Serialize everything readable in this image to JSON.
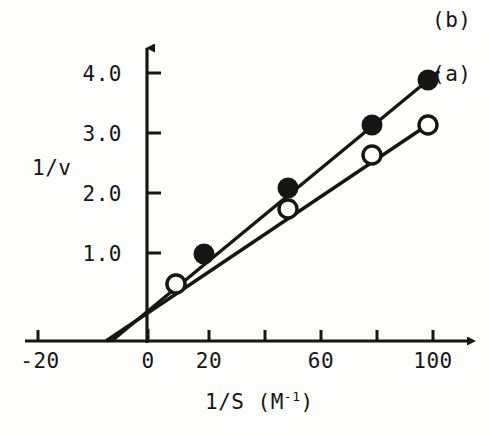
{
  "figure": {
    "background_color": "#fdfdfb",
    "ink_color": "#161616"
  },
  "chart_data": {
    "type": "line",
    "title": "",
    "subtitle": "",
    "xlabel": "1/S (M-1)",
    "xlabel_base": "1/S  (M",
    "xlabel_exponent": "-1",
    "xlabel_close": ")",
    "ylabel": "1/v",
    "xlim": [
      -28,
      112
    ],
    "ylim": [
      0,
      4.75
    ],
    "grid": false,
    "legend_position": "right-of-line-ends",
    "x_ticks": [
      -20,
      0,
      20,
      40,
      60,
      80,
      100
    ],
    "x_tick_labels": [
      "-20",
      "0",
      "20",
      "",
      "60",
      "",
      "100"
    ],
    "y_ticks": [
      1.0,
      2.0,
      3.0,
      4.0
    ],
    "y_tick_labels": [
      "1.0",
      "2.0",
      "3.0",
      "4.0"
    ],
    "x_intercept": -15,
    "y_intercept": 0.6,
    "series": [
      {
        "name": "(a)",
        "label": "(a)",
        "marker": "open-circle",
        "marker_fill": "#ffffff",
        "marker_stroke": "#161616",
        "line_color": "#161616",
        "x": [
          10,
          20,
          50,
          80,
          100
        ],
        "y": [
          0.95,
          1.45,
          2.2,
          3.1,
          3.6
        ],
        "line_from": [
          -15,
          0
        ],
        "line_to": [
          103,
          3.7
        ]
      },
      {
        "name": "(b)",
        "label": "(b)",
        "marker": "filled-circle",
        "marker_fill": "#161616",
        "marker_stroke": "#161616",
        "line_color": "#161616",
        "x": [
          10,
          20,
          50,
          80,
          100
        ],
        "y": [
          0.95,
          1.45,
          2.55,
          3.6,
          4.35
        ],
        "line_from": [
          -13,
          0
        ],
        "line_to": [
          104,
          4.5
        ]
      }
    ]
  },
  "labels": {
    "series_a": "(a)",
    "series_b": "(b)",
    "y_axis": "1/v",
    "x_axis_text": "1/S  (M",
    "x_axis_exponent": "-1",
    "x_axis_paren": ")",
    "ytick_1": "1.0",
    "ytick_2": "2.0",
    "ytick_3": "3.0",
    "ytick_4": "4.0",
    "xtick_neg20": "-20",
    "xtick_0": "0",
    "xtick_20": "20",
    "xtick_60": "60",
    "xtick_100": "100"
  }
}
